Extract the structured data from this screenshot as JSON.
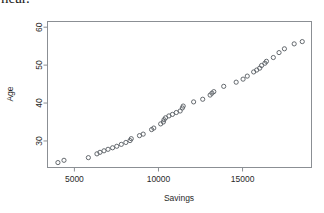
{
  "document": {
    "cut_off_line": "near."
  },
  "chart_data": {
    "type": "scatter",
    "title": "",
    "xlabel": "Savings",
    "ylabel": "Age",
    "xlim": [
      3400,
      19100
    ],
    "ylim": [
      23.0,
      61.5
    ],
    "xticks": [
      5000,
      10000,
      15000
    ],
    "xtick_labels": [
      "5000",
      "10000",
      "15000"
    ],
    "yticks": [
      30,
      40,
      50,
      60
    ],
    "ytick_labels": [
      "30",
      "40",
      "50",
      "60"
    ],
    "grid": false,
    "legend": null,
    "marker": "open-circle",
    "marker_color": "#555a60",
    "frame": true,
    "points": [
      {
        "x": 4020,
        "y": 24.3
      },
      {
        "x": 4380,
        "y": 24.9
      },
      {
        "x": 5830,
        "y": 25.6
      },
      {
        "x": 6340,
        "y": 26.6
      },
      {
        "x": 6520,
        "y": 27.0
      },
      {
        "x": 6760,
        "y": 27.4
      },
      {
        "x": 7000,
        "y": 27.8
      },
      {
        "x": 7270,
        "y": 28.2
      },
      {
        "x": 7520,
        "y": 28.6
      },
      {
        "x": 7790,
        "y": 29.1
      },
      {
        "x": 8060,
        "y": 29.6
      },
      {
        "x": 8310,
        "y": 30.1
      },
      {
        "x": 8380,
        "y": 30.6
      },
      {
        "x": 8870,
        "y": 31.4
      },
      {
        "x": 9090,
        "y": 31.8
      },
      {
        "x": 9590,
        "y": 33.0
      },
      {
        "x": 9720,
        "y": 33.4
      },
      {
        "x": 10130,
        "y": 34.5
      },
      {
        "x": 10290,
        "y": 35.0
      },
      {
        "x": 10330,
        "y": 35.6
      },
      {
        "x": 10420,
        "y": 36.1
      },
      {
        "x": 10620,
        "y": 36.6
      },
      {
        "x": 10830,
        "y": 37.0
      },
      {
        "x": 11060,
        "y": 37.5
      },
      {
        "x": 11290,
        "y": 37.9
      },
      {
        "x": 11420,
        "y": 38.7
      },
      {
        "x": 11470,
        "y": 39.2
      },
      {
        "x": 12090,
        "y": 40.3
      },
      {
        "x": 12630,
        "y": 41.0
      },
      {
        "x": 13070,
        "y": 42.1
      },
      {
        "x": 13180,
        "y": 42.6
      },
      {
        "x": 13290,
        "y": 43.0
      },
      {
        "x": 13880,
        "y": 44.4
      },
      {
        "x": 14620,
        "y": 45.5
      },
      {
        "x": 15030,
        "y": 46.3
      },
      {
        "x": 15280,
        "y": 47.1
      },
      {
        "x": 15660,
        "y": 48.2
      },
      {
        "x": 15840,
        "y": 48.7
      },
      {
        "x": 16020,
        "y": 49.2
      },
      {
        "x": 16130,
        "y": 49.9
      },
      {
        "x": 16330,
        "y": 50.5
      },
      {
        "x": 16420,
        "y": 51.0
      },
      {
        "x": 16830,
        "y": 52.0
      },
      {
        "x": 17170,
        "y": 53.3
      },
      {
        "x": 17490,
        "y": 54.3
      },
      {
        "x": 18070,
        "y": 55.6
      },
      {
        "x": 18550,
        "y": 56.2
      }
    ]
  }
}
